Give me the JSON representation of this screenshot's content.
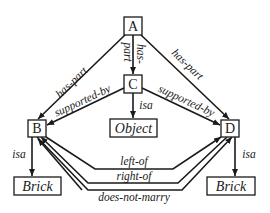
{
  "diagram": {
    "type": "semantic-network",
    "nodes": {
      "A": {
        "label": "A"
      },
      "B": {
        "label": "B"
      },
      "C": {
        "label": "C"
      },
      "D": {
        "label": "D"
      },
      "object": {
        "label": "Object"
      },
      "brick_left": {
        "label": "Brick"
      },
      "brick_right": {
        "label": "Brick"
      }
    },
    "edges": {
      "a_b": {
        "from": "A",
        "to": "B",
        "label": "has-part"
      },
      "a_c_1": {
        "from": "A",
        "to": "C",
        "label": "part"
      },
      "a_c_2": {
        "from": "A",
        "to": "C",
        "label": "has-"
      },
      "a_d": {
        "from": "A",
        "to": "D",
        "label": "has-part"
      },
      "c_b": {
        "from": "C",
        "to": "B",
        "label": "supported-by"
      },
      "c_d": {
        "from": "C",
        "to": "D",
        "label": "supported-by"
      },
      "c_object": {
        "from": "C",
        "to": "Object",
        "label": "isa"
      },
      "b_brick": {
        "from": "B",
        "to": "Brick",
        "label": "isa"
      },
      "d_brick": {
        "from": "D",
        "to": "Brick",
        "label": "isa"
      },
      "b_d_left": {
        "from": "B",
        "to": "D",
        "label": "left-of"
      },
      "d_b_right": {
        "from": "D",
        "to": "B",
        "label": "right-of"
      },
      "b_d_marry": {
        "from": "B",
        "to": "D",
        "label": "does-not-marry"
      }
    },
    "colors": {
      "stroke": "#1a1a1a",
      "background": "#ffffff"
    }
  }
}
